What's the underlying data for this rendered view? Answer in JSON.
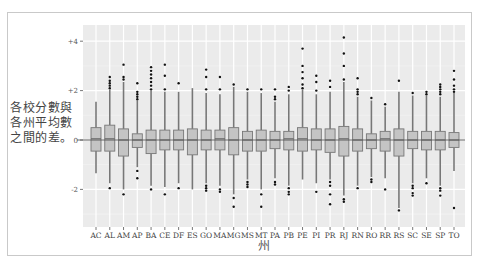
{
  "chart_data": {
    "type": "box",
    "title": "",
    "xlabel": "州",
    "ylabel": "各校分數與各州平均數之間的差。",
    "ylim": [
      -3.5,
      4.6
    ],
    "yticks": [
      {
        "value": 4,
        "label": "+4"
      },
      {
        "value": 2,
        "label": "+2"
      },
      {
        "value": 0,
        "label": "0"
      },
      {
        "value": -2,
        "label": "-2"
      }
    ],
    "grid": true,
    "legend": null,
    "categories": [
      "AC",
      "AL",
      "AM",
      "AP",
      "BA",
      "CE",
      "DF",
      "ES",
      "GO",
      "MA",
      "MG",
      "MS",
      "MT",
      "PA",
      "PB",
      "PE",
      "PI",
      "PR",
      "RJ",
      "RN",
      "RO",
      "RR",
      "RS",
      "SC",
      "SE",
      "SP",
      "TO"
    ],
    "boxes": [
      {
        "cat": "AC",
        "q1": -0.45,
        "median": 0.05,
        "q3": 0.5,
        "wlo": -1.35,
        "whi": 1.55,
        "outliers": []
      },
      {
        "cat": "AL",
        "q1": -0.45,
        "median": 0.05,
        "q3": 0.6,
        "wlo": -1.75,
        "whi": 2.05,
        "outliers": [
          2.1,
          2.2,
          2.3,
          2.4,
          2.55,
          -1.95
        ]
      },
      {
        "cat": "AM",
        "q1": -0.65,
        "median": 0.0,
        "q3": 0.45,
        "wlo": -2.0,
        "whi": 2.35,
        "outliers": [
          2.45,
          2.55,
          3.05,
          -2.2
        ]
      },
      {
        "cat": "AP",
        "q1": -0.3,
        "median": 0.0,
        "q3": 0.25,
        "wlo": -1.1,
        "whi": 1.6,
        "outliers": [
          1.65,
          1.75,
          1.85,
          1.95,
          2.3,
          -1.25,
          -1.55
        ]
      },
      {
        "cat": "BA",
        "q1": -0.55,
        "median": 0.0,
        "q3": 0.4,
        "wlo": -1.85,
        "whi": 2.0,
        "outliers": [
          2.05,
          2.2,
          2.35,
          2.5,
          2.65,
          2.8,
          2.95,
          -2.0
        ]
      },
      {
        "cat": "CE",
        "q1": -0.4,
        "median": 0.0,
        "q3": 0.4,
        "wlo": -1.9,
        "whi": 1.95,
        "outliers": [
          2.05,
          2.6,
          3.05,
          -2.2
        ]
      },
      {
        "cat": "DF",
        "q1": -0.4,
        "median": 0.0,
        "q3": 0.4,
        "wlo": -1.75,
        "whi": 1.95,
        "outliers": [
          2.3,
          -1.95
        ]
      },
      {
        "cat": "ES",
        "q1": -0.6,
        "median": 0.0,
        "q3": 0.45,
        "wlo": -2.0,
        "whi": 2.1,
        "outliers": []
      },
      {
        "cat": "GO",
        "q1": -0.4,
        "median": 0.0,
        "q3": 0.4,
        "wlo": -1.75,
        "whi": 1.9,
        "outliers": [
          2.05,
          2.55,
          2.85,
          -1.85,
          -1.95,
          -2.05
        ]
      },
      {
        "cat": "MA",
        "q1": -0.4,
        "median": 0.05,
        "q3": 0.4,
        "wlo": -1.85,
        "whi": 1.85,
        "outliers": [
          2.05,
          2.55,
          -2.0,
          -2.1
        ]
      },
      {
        "cat": "MG",
        "q1": -0.6,
        "median": 0.0,
        "q3": 0.5,
        "wlo": -2.2,
        "whi": 2.15,
        "outliers": [
          2.25,
          -2.35,
          -2.7
        ]
      },
      {
        "cat": "MS",
        "q1": -0.45,
        "median": 0.0,
        "q3": 0.35,
        "wlo": -1.6,
        "whi": 1.95,
        "outliers": [
          2.05,
          -1.7,
          -1.8,
          -1.9
        ]
      },
      {
        "cat": "MT",
        "q1": -0.45,
        "median": 0.0,
        "q3": 0.4,
        "wlo": -2.0,
        "whi": 1.9,
        "outliers": [
          2.05,
          -2.2,
          -2.7
        ]
      },
      {
        "cat": "PA",
        "q1": -0.35,
        "median": 0.0,
        "q3": 0.35,
        "wlo": -1.55,
        "whi": 1.55,
        "outliers": [
          1.65,
          1.75,
          2.05,
          -1.7,
          -1.8
        ]
      },
      {
        "cat": "PB",
        "q1": -0.4,
        "median": 0.05,
        "q3": 0.35,
        "wlo": -1.85,
        "whi": 1.85,
        "outliers": [
          2.0,
          2.15,
          -1.95,
          -2.1,
          -2.2
        ]
      },
      {
        "cat": "PE",
        "q1": -0.45,
        "median": 0.05,
        "q3": 0.5,
        "wlo": -1.6,
        "whi": 2.05,
        "outliers": [
          2.1,
          2.25,
          2.5,
          2.75,
          3.0,
          3.7
        ]
      },
      {
        "cat": "PI",
        "q1": -0.4,
        "median": 0.0,
        "q3": 0.45,
        "wlo": -1.75,
        "whi": 1.85,
        "outliers": [
          2.0,
          2.35,
          2.6,
          -2.1
        ]
      },
      {
        "cat": "PR",
        "q1": -0.5,
        "median": 0.0,
        "q3": 0.45,
        "wlo": -1.6,
        "whi": 1.95,
        "outliers": [
          2.15,
          2.4,
          -1.7,
          -1.85,
          -2.2,
          -2.6
        ]
      },
      {
        "cat": "RJ",
        "q1": -0.65,
        "median": 0.05,
        "q3": 0.55,
        "wlo": -2.25,
        "whi": 2.35,
        "outliers": [
          2.45,
          3.0,
          3.5,
          4.15,
          -2.4,
          -2.5
        ]
      },
      {
        "cat": "RN",
        "q1": -0.45,
        "median": 0.0,
        "q3": 0.45,
        "wlo": -1.85,
        "whi": 1.75,
        "outliers": [
          1.85,
          1.95,
          2.05,
          2.5,
          -1.95
        ]
      },
      {
        "cat": "RO",
        "q1": -0.35,
        "median": 0.0,
        "q3": 0.25,
        "wlo": -1.5,
        "whi": 1.6,
        "outliers": [
          1.7,
          -1.6,
          -1.7
        ]
      },
      {
        "cat": "RR",
        "q1": -0.45,
        "median": 0.05,
        "q3": 0.35,
        "wlo": -1.55,
        "whi": 1.35,
        "outliers": [
          1.45,
          -2.0
        ]
      },
      {
        "cat": "RS",
        "q1": -0.65,
        "median": 0.0,
        "q3": 0.45,
        "wlo": -2.75,
        "whi": 1.95,
        "outliers": [
          2.4,
          -2.85
        ]
      },
      {
        "cat": "SC",
        "q1": -0.35,
        "median": 0.0,
        "q3": 0.35,
        "wlo": -1.75,
        "whi": 1.8,
        "outliers": [
          1.9,
          -1.85,
          -1.95,
          -2.15,
          -2.25
        ]
      },
      {
        "cat": "SE",
        "q1": -0.4,
        "median": 0.0,
        "q3": 0.35,
        "wlo": -1.55,
        "whi": 1.8,
        "outliers": [
          1.85,
          1.95,
          -1.75
        ]
      },
      {
        "cat": "SP",
        "q1": -0.4,
        "median": 0.0,
        "q3": 0.35,
        "wlo": -1.85,
        "whi": 1.75,
        "outliers": [
          1.85,
          1.95,
          2.05,
          2.15,
          2.25,
          -1.95,
          -2.05,
          -2.25
        ]
      },
      {
        "cat": "TO",
        "q1": -0.3,
        "median": 0.0,
        "q3": 0.3,
        "wlo": -1.25,
        "whi": 1.9,
        "outliers": [
          1.95,
          2.05,
          2.2,
          2.45,
          2.8,
          -2.75
        ]
      }
    ]
  },
  "axis": {
    "y_title": "各校分數與各州平均數之間的差。",
    "x_title": "州"
  }
}
